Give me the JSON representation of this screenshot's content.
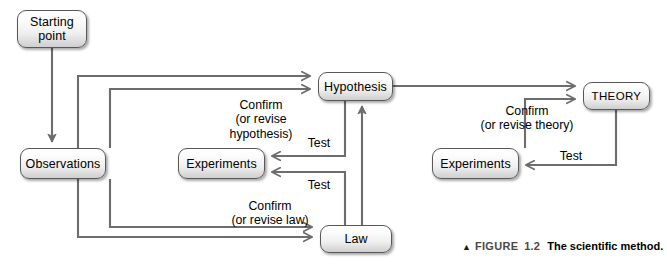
{
  "figure": {
    "caption_marker": "▲",
    "caption_label": "FIGURE",
    "caption_number": "1.2",
    "caption_title": "The scientific method.",
    "background_color": "#ffffff",
    "line_color": "#6d6d70",
    "box_border_color": "#58585a",
    "text_color": "#000000"
  },
  "diagram": {
    "type": "flowchart",
    "title": "The scientific method",
    "nodes": [
      {
        "id": "starting-point",
        "label": "Starting\npoint",
        "x": 17,
        "y": 10,
        "w": 70,
        "h": 38
      },
      {
        "id": "observations",
        "label": "Observations",
        "x": 20,
        "y": 148,
        "w": 86,
        "h": 31
      },
      {
        "id": "hypothesis",
        "label": "Hypothesis",
        "x": 318,
        "y": 72,
        "w": 75,
        "h": 29
      },
      {
        "id": "experiments-left",
        "label": "Experiments",
        "x": 178,
        "y": 148,
        "w": 87,
        "h": 31
      },
      {
        "id": "experiments-right",
        "label": "Experiments",
        "x": 432,
        "y": 148,
        "w": 87,
        "h": 31
      },
      {
        "id": "law",
        "label": "Law",
        "x": 320,
        "y": 225,
        "w": 72,
        "h": 28
      },
      {
        "id": "theory",
        "label": "THEORY",
        "x": 583,
        "y": 82,
        "w": 67,
        "h": 28
      }
    ],
    "edge_labels": [
      {
        "id": "confirm-hypothesis",
        "text": "Confirm\n(or revise\nhypothesis)",
        "x": 203,
        "y": 98,
        "w": 116
      },
      {
        "id": "confirm-theory",
        "text": "Confirm\n(or revise theory)",
        "x": 462,
        "y": 104,
        "w": 130
      },
      {
        "id": "confirm-law",
        "text": "Confirm\n(or revise law)",
        "x": 205,
        "y": 199,
        "w": 130
      },
      {
        "id": "test-hypothesis",
        "text": "Test",
        "x": 300,
        "y": 136,
        "w": 38
      },
      {
        "id": "test-law",
        "text": "Test",
        "x": 300,
        "y": 178,
        "w": 38
      },
      {
        "id": "test-theory",
        "text": "Test",
        "x": 552,
        "y": 149,
        "w": 38
      }
    ],
    "edges": [
      {
        "id": "start-to-observations",
        "from": "starting-point",
        "to": "observations",
        "label": ""
      },
      {
        "id": "observations-to-hypothesis",
        "from": "observations",
        "to": "hypothesis",
        "label": ""
      },
      {
        "id": "observations-to-law",
        "from": "observations",
        "to": "law",
        "label": ""
      },
      {
        "id": "hypothesis-to-experiments",
        "from": "hypothesis",
        "to": "experiments-left",
        "label": "Test"
      },
      {
        "id": "experiments-to-hypothesis",
        "from": "experiments-left",
        "to": "hypothesis",
        "label": "Confirm (or revise hypothesis)"
      },
      {
        "id": "law-to-experiments",
        "from": "law",
        "to": "experiments-left",
        "label": "Test"
      },
      {
        "id": "experiments-to-law",
        "from": "experiments-left",
        "to": "law",
        "label": "Confirm (or revise law)"
      },
      {
        "id": "law-to-hypothesis",
        "from": "law",
        "to": "hypothesis",
        "label": ""
      },
      {
        "id": "hypothesis-to-theory",
        "from": "hypothesis",
        "to": "theory",
        "label": ""
      },
      {
        "id": "theory-to-experiments",
        "from": "theory",
        "to": "experiments-right",
        "label": "Test"
      },
      {
        "id": "experiments-to-theory",
        "from": "experiments-right",
        "to": "theory",
        "label": "Confirm (or revise theory)"
      }
    ]
  }
}
